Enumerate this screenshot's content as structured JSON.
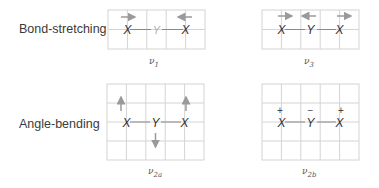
{
  "rows": [
    {
      "label": "Bond-stretching"
    },
    {
      "label": "Angle-bending"
    }
  ],
  "modes": [
    {
      "id": "v1",
      "symbol": "ν",
      "subscript": "1",
      "atoms": [
        "X",
        "Y",
        "X"
      ],
      "center_faded": true,
      "arrows": [
        "right",
        "none",
        "left"
      ],
      "signs": []
    },
    {
      "id": "v3",
      "symbol": "ν",
      "subscript": "3",
      "atoms": [
        "X",
        "Y",
        "X"
      ],
      "center_faded": false,
      "arrows": [
        "right",
        "left",
        "right"
      ],
      "signs": []
    },
    {
      "id": "v2a",
      "symbol": "ν",
      "subscript": "2a",
      "atoms": [
        "X",
        "Y",
        "X"
      ],
      "center_faded": false,
      "arrows": [
        "up",
        "down",
        "up"
      ],
      "signs": []
    },
    {
      "id": "v2b",
      "symbol": "ν",
      "subscript": "2b",
      "atoms": [
        "X",
        "Y",
        "X"
      ],
      "center_faded": false,
      "arrows": [],
      "signs": [
        "+",
        "−",
        "+"
      ]
    }
  ],
  "colors": {
    "grid": "#d4d4d4",
    "bond": "#8a8a8a",
    "arrow": "#9a9a9a",
    "atom": "#333333",
    "faded_atom": "#b0b0b0"
  }
}
